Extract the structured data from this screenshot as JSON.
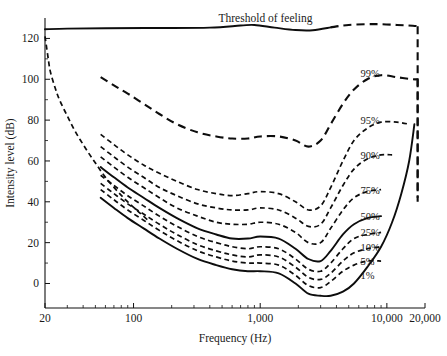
{
  "chart_data": {
    "type": "line",
    "title": "",
    "xlabel": "Frequency (Hz)",
    "ylabel": "Intensity level (dB)",
    "xscale": "log",
    "xlim": [
      20,
      20000
    ],
    "ylim": [
      -12,
      130
    ],
    "grid": false,
    "legend": "inline-right-labels",
    "x_ticks": [
      {
        "value": 20,
        "label": "20"
      },
      {
        "value": 100,
        "label": "100"
      },
      {
        "value": 1000,
        "label": "1,000"
      },
      {
        "value": 10000,
        "label": "10,000"
      },
      {
        "value": 20000,
        "label": "20,000"
      }
    ],
    "x_minor_ticks": [
      30,
      40,
      50,
      60,
      70,
      80,
      90,
      200,
      300,
      400,
      500,
      600,
      700,
      800,
      900,
      2000,
      3000,
      4000,
      5000,
      6000,
      7000,
      8000,
      9000
    ],
    "y_ticks": [
      {
        "value": 0,
        "label": "0"
      },
      {
        "value": 20,
        "label": "20"
      },
      {
        "value": 40,
        "label": "40"
      },
      {
        "value": 60,
        "label": "60"
      },
      {
        "value": 80,
        "label": "80"
      },
      {
        "value": 100,
        "label": "100"
      },
      {
        "value": 120,
        "label": "120"
      }
    ],
    "y_minor_ticks": [
      10,
      30,
      50,
      70,
      90,
      110
    ],
    "annotations": [
      {
        "name": "threshold-of-feeling",
        "text": "Threshold of feeling",
        "x": 1100,
        "y": 128
      }
    ],
    "series": [
      {
        "name": "Threshold of feeling",
        "label": "Threshold of feeling",
        "style": "solid-then-dashed",
        "points": [
          [
            20,
            124.5
          ],
          [
            30,
            124.8
          ],
          [
            60,
            125.0
          ],
          [
            150,
            125.1
          ],
          [
            400,
            125.3
          ],
          [
            700,
            126.3
          ],
          [
            900,
            126.6
          ],
          [
            1300,
            125.3
          ],
          [
            1900,
            124.1
          ],
          [
            2600,
            124.0
          ],
          [
            3600,
            125.4
          ],
          [
            5000,
            126.6
          ],
          [
            8000,
            127.0
          ],
          [
            12000,
            126.6
          ],
          [
            16000,
            126.2
          ],
          [
            17500,
            126.0
          ]
        ],
        "dash_from_x": 3600,
        "drop_at_x": 17500,
        "drop_to_y": 42
      },
      {
        "name": "low-frequency-threshold",
        "label": "",
        "style": "dashed",
        "points": [
          [
            20,
            121
          ],
          [
            21,
            112
          ],
          [
            22,
            104
          ],
          [
            24,
            96
          ],
          [
            26,
            90
          ],
          [
            30,
            82
          ],
          [
            35,
            74
          ],
          [
            42,
            66
          ],
          [
            50,
            59
          ],
          [
            60,
            52
          ],
          [
            75,
            45
          ],
          [
            90,
            40
          ],
          [
            110,
            35
          ],
          [
            130,
            31
          ]
        ]
      },
      {
        "name": "99%",
        "label": "99%",
        "style": "dashed",
        "label_pos": [
          6200,
          103
        ],
        "points": [
          [
            55,
            101
          ],
          [
            70,
            97
          ],
          [
            90,
            93
          ],
          [
            120,
            88
          ],
          [
            160,
            83
          ],
          [
            220,
            78
          ],
          [
            320,
            74
          ],
          [
            450,
            72
          ],
          [
            600,
            71
          ],
          [
            800,
            71
          ],
          [
            1000,
            72
          ],
          [
            1400,
            72
          ],
          [
            1900,
            70
          ],
          [
            2400,
            67
          ],
          [
            3000,
            70
          ],
          [
            3600,
            78
          ],
          [
            4500,
            88
          ],
          [
            5500,
            95
          ],
          [
            7000,
            100
          ],
          [
            9000,
            102
          ],
          [
            12000,
            101
          ],
          [
            16000,
            100
          ],
          [
            17500,
            100
          ]
        ],
        "drop_at_x": 17500,
        "drop_to_y": 40
      },
      {
        "name": "95%",
        "label": "95%",
        "style": "dashed",
        "label_pos": [
          6200,
          80
        ],
        "points": [
          [
            55,
            73
          ],
          [
            70,
            68
          ],
          [
            90,
            63
          ],
          [
            120,
            58
          ],
          [
            160,
            54
          ],
          [
            220,
            50
          ],
          [
            320,
            46
          ],
          [
            450,
            44
          ],
          [
            600,
            43
          ],
          [
            800,
            44
          ],
          [
            1000,
            45
          ],
          [
            1400,
            44
          ],
          [
            1900,
            40
          ],
          [
            2400,
            36
          ],
          [
            3000,
            38
          ],
          [
            3600,
            47
          ],
          [
            4500,
            60
          ],
          [
            5500,
            70
          ],
          [
            7000,
            76
          ],
          [
            9000,
            79
          ],
          [
            12000,
            79
          ],
          [
            15000,
            78
          ]
        ]
      },
      {
        "name": "90%",
        "label": "90%",
        "style": "dashed",
        "label_pos": [
          6200,
          63
        ],
        "points": [
          [
            55,
            67
          ],
          [
            70,
            62
          ],
          [
            90,
            57
          ],
          [
            120,
            52
          ],
          [
            160,
            47
          ],
          [
            220,
            43
          ],
          [
            320,
            39
          ],
          [
            450,
            37
          ],
          [
            600,
            36
          ],
          [
            800,
            36
          ],
          [
            1000,
            37
          ],
          [
            1400,
            36
          ],
          [
            1900,
            32
          ],
          [
            2400,
            28
          ],
          [
            3000,
            29
          ],
          [
            3600,
            37
          ],
          [
            4500,
            48
          ],
          [
            5500,
            56
          ],
          [
            7000,
            61
          ],
          [
            9000,
            63
          ],
          [
            11000,
            63
          ]
        ]
      },
      {
        "name": "75%",
        "label": "75%",
        "style": "dashed",
        "label_pos": [
          6200,
          46
        ],
        "points": [
          [
            55,
            62
          ],
          [
            70,
            57
          ],
          [
            90,
            52
          ],
          [
            120,
            47
          ],
          [
            160,
            42
          ],
          [
            220,
            37
          ],
          [
            320,
            33
          ],
          [
            450,
            30
          ],
          [
            600,
            29
          ],
          [
            800,
            29
          ],
          [
            1000,
            30
          ],
          [
            1400,
            29
          ],
          [
            1900,
            25
          ],
          [
            2400,
            20
          ],
          [
            3000,
            20
          ],
          [
            3600,
            27
          ],
          [
            4500,
            36
          ],
          [
            5500,
            42
          ],
          [
            7000,
            45
          ],
          [
            9000,
            46
          ]
        ]
      },
      {
        "name": "50%",
        "label": "50%",
        "style": "solid",
        "label_pos": [
          6200,
          33
        ],
        "points": [
          [
            55,
            57
          ],
          [
            70,
            52
          ],
          [
            90,
            47
          ],
          [
            120,
            42
          ],
          [
            160,
            37
          ],
          [
            220,
            32
          ],
          [
            320,
            27
          ],
          [
            450,
            24
          ],
          [
            600,
            22
          ],
          [
            800,
            22
          ],
          [
            1000,
            23
          ],
          [
            1400,
            22
          ],
          [
            1900,
            17
          ],
          [
            2400,
            12
          ],
          [
            3000,
            11
          ],
          [
            3600,
            16
          ],
          [
            4500,
            24
          ],
          [
            5500,
            29
          ],
          [
            7000,
            32
          ],
          [
            9000,
            33
          ]
        ]
      },
      {
        "name": "25%",
        "label": "25%",
        "style": "dashed",
        "label_pos": [
          6200,
          25
        ],
        "points": [
          [
            55,
            53
          ],
          [
            70,
            48
          ],
          [
            90,
            43
          ],
          [
            120,
            38
          ],
          [
            160,
            33
          ],
          [
            220,
            28
          ],
          [
            320,
            23
          ],
          [
            450,
            20
          ],
          [
            600,
            18
          ],
          [
            800,
            17
          ],
          [
            1000,
            18
          ],
          [
            1400,
            17
          ],
          [
            1900,
            12
          ],
          [
            2400,
            7
          ],
          [
            3000,
            6
          ],
          [
            3600,
            10
          ],
          [
            4500,
            17
          ],
          [
            5500,
            22
          ],
          [
            7000,
            24
          ],
          [
            9000,
            25
          ]
        ]
      },
      {
        "name": "10%",
        "label": "10%",
        "style": "dashed",
        "label_pos": [
          6200,
          18
        ],
        "points": [
          [
            55,
            49
          ],
          [
            70,
            44
          ],
          [
            90,
            39
          ],
          [
            120,
            34
          ],
          [
            160,
            29
          ],
          [
            220,
            24
          ],
          [
            320,
            19
          ],
          [
            450,
            16
          ],
          [
            600,
            14
          ],
          [
            800,
            13
          ],
          [
            1000,
            14
          ],
          [
            1400,
            13
          ],
          [
            1900,
            8
          ],
          [
            2400,
            3
          ],
          [
            3000,
            2
          ],
          [
            3600,
            5
          ],
          [
            4500,
            11
          ],
          [
            5500,
            15
          ],
          [
            7000,
            17
          ],
          [
            9000,
            18
          ]
        ]
      },
      {
        "name": "5%",
        "label": "5%",
        "style": "dashed",
        "label_pos": [
          6200,
          11
        ],
        "points": [
          [
            55,
            46
          ],
          [
            70,
            41
          ],
          [
            90,
            36
          ],
          [
            120,
            31
          ],
          [
            160,
            26
          ],
          [
            220,
            21
          ],
          [
            320,
            16
          ],
          [
            450,
            13
          ],
          [
            600,
            11
          ],
          [
            800,
            10
          ],
          [
            1000,
            10
          ],
          [
            1400,
            9
          ],
          [
            1900,
            4
          ],
          [
            2400,
            -1
          ],
          [
            3000,
            -2
          ],
          [
            3600,
            1
          ],
          [
            4500,
            6
          ],
          [
            5500,
            9
          ],
          [
            7000,
            11
          ],
          [
            9000,
            11
          ]
        ]
      },
      {
        "name": "1%",
        "label": "1%",
        "style": "solid",
        "label_pos": [
          6200,
          4
        ],
        "points": [
          [
            55,
            42
          ],
          [
            70,
            37
          ],
          [
            90,
            32
          ],
          [
            120,
            27
          ],
          [
            160,
            22
          ],
          [
            220,
            17
          ],
          [
            320,
            12
          ],
          [
            450,
            9
          ],
          [
            600,
            7
          ],
          [
            800,
            6
          ],
          [
            1000,
            6
          ],
          [
            1400,
            5
          ],
          [
            1900,
            0
          ],
          [
            2400,
            -5
          ],
          [
            3000,
            -6
          ],
          [
            3600,
            -6
          ],
          [
            4500,
            -4
          ],
          [
            5500,
            0
          ],
          [
            7000,
            8
          ],
          [
            9000,
            18
          ],
          [
            11000,
            30
          ],
          [
            13000,
            44
          ],
          [
            15000,
            60
          ],
          [
            16500,
            78
          ]
        ]
      }
    ]
  },
  "axis": {
    "x_title": "Frequency (Hz)",
    "y_title": "Intensity level (dB)"
  },
  "caption": {
    "ghost_text": ""
  }
}
